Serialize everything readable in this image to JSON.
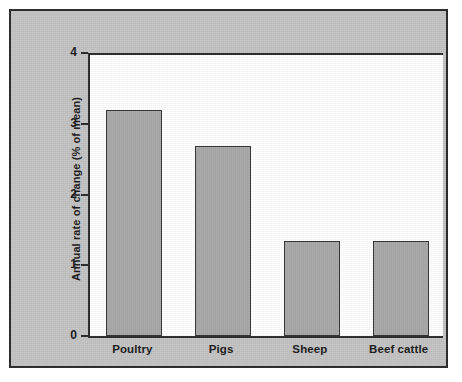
{
  "chart_data": {
    "type": "bar",
    "title": "",
    "subtitle": "",
    "xlabel": "",
    "ylabel": "Annual rate of change (% of mean)",
    "categories": [
      "Poultry",
      "Pigs",
      "Sheep",
      "Beef cattle"
    ],
    "values": [
      3.2,
      2.68,
      1.35,
      1.35
    ],
    "ylim": [
      0,
      4
    ],
    "yticks": [
      "0",
      "1",
      "2",
      "3",
      "4"
    ],
    "ytick_values": [
      0,
      1,
      2,
      3,
      4
    ],
    "grid": false,
    "legend": null,
    "annotations": []
  },
  "style": {
    "bar_fill": "#a9a9a9",
    "bar_stroke": "#343434",
    "panel_background": "#c3c3c3",
    "plot_background": "#ffffff",
    "axis_color": "#2a2a2a",
    "text_color": "#1a1a1a",
    "page_background": "#ffffff"
  }
}
